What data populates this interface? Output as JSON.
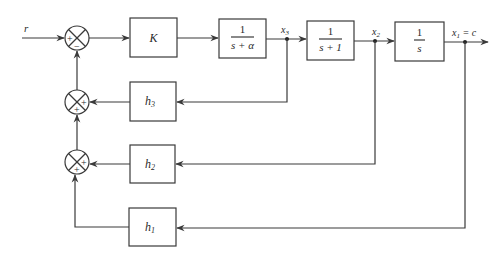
{
  "diagram": {
    "type": "control-system-block-diagram",
    "input_label": "r",
    "output_label": "x1 = c",
    "forward_blocks": [
      {
        "id": "gain",
        "label": "K"
      },
      {
        "id": "plant1",
        "numerator": "1",
        "denominator": "s + α"
      },
      {
        "id": "plant2",
        "numerator": "1",
        "denominator": "s + 1"
      },
      {
        "id": "integrator",
        "numerator": "1",
        "denominator": "s"
      }
    ],
    "feedback_blocks": [
      {
        "id": "h3",
        "label": "h",
        "subscript": "3",
        "tap": "x3"
      },
      {
        "id": "h2",
        "label": "h",
        "subscript": "2",
        "tap": "x2"
      },
      {
        "id": "h1",
        "label": "h",
        "subscript": "1",
        "tap": "x1"
      }
    ],
    "signals": {
      "x3": {
        "label": "x",
        "subscript": "3"
      },
      "x2": {
        "label": "x",
        "subscript": "2"
      },
      "x1": {
        "label": "x",
        "subscript": "1",
        "suffix": " = c"
      }
    },
    "summing_junctions": [
      {
        "id": "main",
        "signs": [
          "+",
          "−"
        ]
      },
      {
        "id": "fb3",
        "signs": [
          "+",
          "+"
        ]
      },
      {
        "id": "fb2",
        "signs": [
          "+",
          "+"
        ]
      }
    ]
  }
}
